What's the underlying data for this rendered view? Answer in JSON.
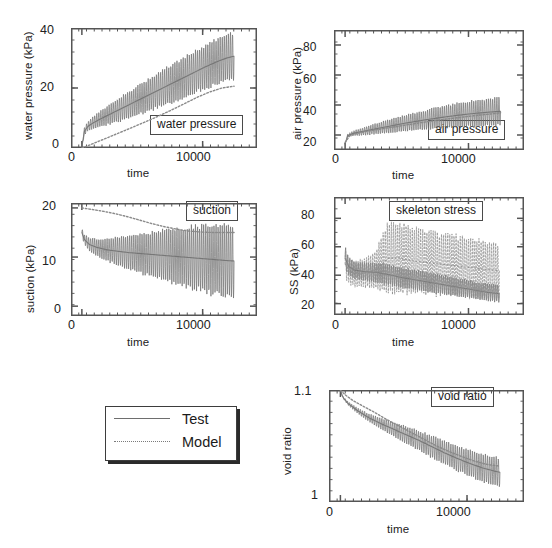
{
  "figure": {
    "background": "#ffffff",
    "series_colors": {
      "test": "#6e6e6e",
      "model": "#8a8a8a"
    }
  },
  "legend": {
    "name": "series-legend",
    "entries": [
      {
        "label": "Test",
        "style": "solid"
      },
      {
        "label": "Model",
        "style": "dotted"
      }
    ]
  },
  "chart_data": [
    {
      "id": "water-pressure",
      "type": "line",
      "title": "water pressure",
      "xlabel": "time",
      "ylabel": "water pressure (kPa)",
      "xlim": [
        -900,
        14500
      ],
      "ylim": [
        0,
        40
      ],
      "xticks": [
        0,
        10000
      ],
      "xticklabels": [
        "0",
        "10000"
      ],
      "yticks": [
        0,
        20,
        40
      ],
      "yticklabels": [
        "0",
        "20",
        "40"
      ],
      "grid": false,
      "legend_position": "lower-right",
      "series": [
        {
          "name": "Test",
          "style": "solid",
          "oscillating": true,
          "x": [
            0,
            200,
            500,
            900,
            1500,
            2200,
            3000,
            3900,
            4800,
            5700,
            6600,
            7500,
            8400,
            9300,
            10200,
            11100,
            12000,
            12600
          ],
          "values": [
            0.3,
            5.5,
            7.2,
            8.3,
            9.6,
            11.0,
            12.6,
            14.4,
            16.2,
            18.0,
            19.8,
            21.6,
            23.4,
            25.2,
            27.0,
            28.6,
            30.0,
            30.6
          ],
          "amplitude": [
            0.2,
            1.2,
            1.6,
            2.0,
            2.6,
            3.2,
            3.9,
            4.5,
            5.0,
            5.5,
            6.0,
            6.4,
            6.8,
            7.1,
            7.4,
            7.6,
            7.8,
            7.9
          ]
        },
        {
          "name": "Model",
          "style": "dotted",
          "oscillating": false,
          "x": [
            0,
            400,
            1000,
            1800,
            2700,
            3600,
            4600,
            5600,
            6600,
            7600,
            8600,
            9600,
            10600,
            11600,
            12600
          ],
          "values": [
            0.0,
            0.6,
            1.6,
            2.9,
            4.4,
            5.9,
            7.6,
            9.3,
            11.1,
            13.0,
            15.0,
            17.0,
            18.7,
            20.0,
            20.6
          ]
        }
      ]
    },
    {
      "id": "air-pressure",
      "type": "line",
      "title": "air pressure",
      "xlabel": "time",
      "ylabel": "air pressure (kPa)",
      "xlim": [
        -900,
        14500
      ],
      "ylim": [
        10,
        90
      ],
      "xticks": [
        0,
        10000
      ],
      "xticklabels": [
        "0",
        "10000"
      ],
      "yticks": [
        20,
        40,
        60,
        80
      ],
      "yticklabels": [
        "20",
        "40",
        "60",
        "80"
      ],
      "grid": false,
      "legend_position": "lower-right",
      "series": [
        {
          "name": "Test",
          "style": "solid",
          "oscillating": true,
          "x": [
            0,
            200,
            600,
            1200,
            2000,
            2900,
            3900,
            4900,
            5900,
            6900,
            7900,
            8900,
            9900,
            10900,
            11900,
            12600
          ],
          "values": [
            14.0,
            19.5,
            21.0,
            22.0,
            23.3,
            24.8,
            26.4,
            27.9,
            29.3,
            30.6,
            31.8,
            32.9,
            33.9,
            34.7,
            35.4,
            35.8
          ],
          "amplitude": [
            0.3,
            1.0,
            1.6,
            2.3,
            3.1,
            3.9,
            4.7,
            5.4,
            6.1,
            6.8,
            7.4,
            8.0,
            8.5,
            9.0,
            9.4,
            9.6
          ]
        },
        {
          "name": "Model",
          "style": "dotted",
          "oscillating": false,
          "x": [
            0,
            400,
            1200,
            2400,
            3800,
            5200,
            6600,
            8000,
            9400,
            10800,
            12000,
            12600
          ],
          "values": [
            15.0,
            19.8,
            21.6,
            23.4,
            25.2,
            27.0,
            28.8,
            30.4,
            31.8,
            33.2,
            34.2,
            34.8
          ]
        }
      ]
    },
    {
      "id": "suction",
      "type": "line",
      "title": "suction",
      "xlabel": "time",
      "ylabel": "suction (kPa)",
      "xlim": [
        -900,
        14500
      ],
      "ylim": [
        -2,
        21
      ],
      "xticks": [
        0,
        10000
      ],
      "xticklabels": [
        "0",
        "10000"
      ],
      "yticks": [
        0,
        10,
        20
      ],
      "yticklabels": [
        "0",
        "10",
        "20"
      ],
      "grid": false,
      "legend_position": "upper-right",
      "series": [
        {
          "name": "Test",
          "style": "solid",
          "oscillating": true,
          "x": [
            0,
            200,
            600,
            1200,
            2000,
            2900,
            3900,
            4900,
            5900,
            6900,
            7900,
            8900,
            9900,
            10900,
            11900,
            12600
          ],
          "values": [
            15.0,
            13.6,
            12.6,
            12.0,
            11.5,
            11.2,
            10.9,
            10.7,
            10.5,
            10.3,
            10.1,
            9.9,
            9.7,
            9.5,
            9.3,
            9.2
          ],
          "amplitude": [
            0.8,
            1.0,
            1.3,
            1.7,
            2.2,
            2.8,
            3.4,
            4.0,
            4.6,
            5.2,
            5.7,
            6.2,
            6.7,
            7.1,
            7.4,
            7.6
          ]
        },
        {
          "name": "Model",
          "style": "dotted",
          "oscillating": false,
          "x": [
            0,
            800,
            1800,
            2800,
            3800,
            4800,
            5800,
            6800,
            7800,
            8800,
            9800,
            10800,
            11800,
            12600
          ],
          "values": [
            20.0,
            19.7,
            19.3,
            18.8,
            18.2,
            17.5,
            16.8,
            16.2,
            15.7,
            15.3,
            15.1,
            15.0,
            15.0,
            15.0
          ]
        }
      ]
    },
    {
      "id": "skeleton-stress",
      "type": "line",
      "title": "skeleton stress",
      "xlabel": "time",
      "ylabel": "SS (kPa)",
      "xlim": [
        -900,
        14500
      ],
      "ylim": [
        12,
        95
      ],
      "xticks": [
        0,
        10000
      ],
      "xticklabels": [
        "0",
        "10000"
      ],
      "yticks": [
        20,
        40,
        60,
        80
      ],
      "yticklabels": [
        "20",
        "40",
        "60",
        "80"
      ],
      "grid": false,
      "legend_position": "upper-right",
      "series": [
        {
          "name": "Test",
          "style": "solid",
          "oscillating": true,
          "x": [
            0,
            300,
            800,
            1600,
            2500,
            3500,
            4500,
            5500,
            6500,
            7500,
            8500,
            9500,
            10500,
            11500,
            12500
          ],
          "values": [
            52.0,
            46.0,
            43.5,
            42.5,
            42.0,
            40.5,
            38.5,
            37.0,
            35.5,
            34.0,
            32.5,
            31.0,
            29.5,
            28.0,
            27.0
          ],
          "amplitude": [
            8.0,
            6.5,
            6.0,
            6.5,
            7.0,
            7.0,
            7.0,
            7.0,
            7.0,
            7.0,
            6.5,
            6.5,
            6.0,
            6.0,
            6.0
          ]
        },
        {
          "name": "Model",
          "style": "dotted",
          "oscillating": true,
          "x": [
            0,
            300,
            800,
            1600,
            2500,
            3500,
            4500,
            5500,
            6500,
            7500,
            8500,
            9500,
            10500,
            11500,
            12500
          ],
          "values": [
            48.0,
            43.0,
            41.0,
            41.5,
            44.0,
            52.0,
            52.0,
            50.0,
            49.0,
            48.0,
            47.0,
            46.0,
            45.0,
            44.0,
            43.0
          ],
          "amplitude": [
            10.0,
            9.0,
            9.0,
            10.0,
            13.0,
            26.0,
            24.0,
            23.0,
            22.5,
            22.0,
            21.5,
            21.0,
            20.5,
            20.0,
            19.5
          ]
        }
      ]
    },
    {
      "id": "void-ratio",
      "type": "line",
      "title": "void ratio",
      "xlabel": "time",
      "ylabel": "void ratio",
      "xlim": [
        -900,
        14500
      ],
      "ylim": [
        1.0,
        1.1
      ],
      "xticks": [
        0,
        10000
      ],
      "xticklabels": [
        "0",
        "10000"
      ],
      "yticks": [
        1.0,
        1.1
      ],
      "yticklabels": [
        "1",
        "1.1"
      ],
      "grid": false,
      "legend_position": "upper-right",
      "series": [
        {
          "name": "Test",
          "style": "solid",
          "oscillating": true,
          "x": [
            0,
            200,
            600,
            1300,
            2200,
            3200,
            4200,
            5200,
            6200,
            7200,
            8200,
            9200,
            10200,
            11200,
            12200,
            12600
          ],
          "values": [
            1.0995,
            1.0935,
            1.088,
            1.082,
            1.0755,
            1.07,
            1.065,
            1.06,
            1.055,
            1.0495,
            1.044,
            1.039,
            1.0345,
            1.0305,
            1.0275,
            1.0265
          ],
          "amplitude": [
            0.0004,
            0.001,
            0.0016,
            0.0024,
            0.0035,
            0.005,
            0.0065,
            0.0078,
            0.0088,
            0.0098,
            0.0106,
            0.0113,
            0.0119,
            0.0124,
            0.0128,
            0.013
          ]
        },
        {
          "name": "Model",
          "style": "dotted",
          "oscillating": false,
          "x": [
            0,
            400,
            1000,
            1800,
            2700,
            3600,
            4600,
            5600,
            6600,
            7600,
            8600,
            9600,
            10600,
            11600,
            12600
          ],
          "values": [
            1.0998,
            1.0955,
            1.0905,
            1.0855,
            1.08,
            1.074,
            1.068,
            1.062,
            1.056,
            1.05,
            1.045,
            1.0405,
            1.0365,
            1.0335,
            1.032
          ]
        }
      ]
    }
  ]
}
